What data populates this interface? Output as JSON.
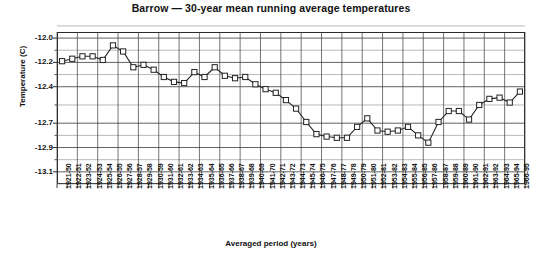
{
  "chart_data": {
    "type": "line",
    "title": "Barrow — 30-year mean running average temperatures",
    "xlabel": "Averaged period (years)",
    "ylabel": "Temperature (C)",
    "ylim": [
      -13.2,
      -11.95
    ],
    "ytick_labels": [
      "-12.0",
      "-12.2",
      "-12.4",
      "-12.7",
      "-12.9",
      "-13.1"
    ],
    "ytick_values": [
      -12.0,
      -12.2,
      -12.4,
      -12.7,
      -12.9,
      -13.1
    ],
    "grid": true,
    "legend": "none",
    "marker": "open-square",
    "line_color": "#222222",
    "marker_color": "#ffffff",
    "categories": [
      "1921-50",
      "1922-51",
      "1923-52",
      "1924-53",
      "1925-54",
      "1926-55",
      "1927-56",
      "1928-57",
      "1929-58",
      "1930-59",
      "1931-60",
      "1932-61",
      "1933-62",
      "1934-63",
      "1935-64",
      "1936-65",
      "1937-66",
      "1938-67",
      "1939-68",
      "1940-69",
      "1941-70",
      "1942-71",
      "1943-72",
      "1944-73",
      "1945-74",
      "1946-75",
      "1947-76",
      "1948-77",
      "1949-78",
      "1950-79",
      "1951-80",
      "1952-81",
      "1953-82",
      "1954-83",
      "1955-84",
      "1956-85",
      "1957-86",
      "1958-87",
      "1959-88",
      "1960-89",
      "1961-90",
      "1962-91",
      "1963-92",
      "1964-93",
      "1965-94",
      "1966-95"
    ],
    "values": [
      -12.19,
      -12.17,
      -12.15,
      -12.15,
      -12.18,
      -12.06,
      -12.11,
      -12.24,
      -12.22,
      -12.26,
      -12.32,
      -12.36,
      -12.37,
      -12.28,
      -12.32,
      -12.24,
      -12.31,
      -12.33,
      -12.32,
      -12.38,
      -12.42,
      -12.45,
      -12.51,
      -12.58,
      -12.69,
      -12.79,
      -12.81,
      -12.82,
      -12.82,
      -12.73,
      -12.66,
      -12.76,
      -12.77,
      -12.76,
      -12.73,
      -12.8,
      -12.86,
      -12.69,
      -12.6,
      -12.6,
      -12.67,
      -12.55,
      -12.5,
      -12.49,
      -12.53,
      -12.44
    ]
  }
}
